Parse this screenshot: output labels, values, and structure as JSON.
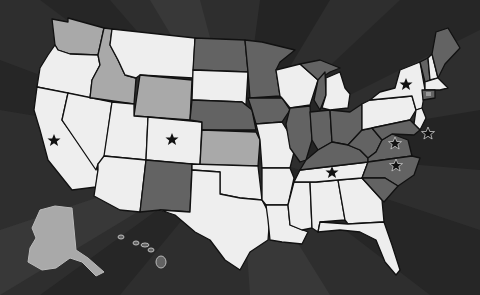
{
  "map": {
    "title": "United States map",
    "style": "grayscale sunburst background",
    "colors": {
      "background": "#2e2e2e",
      "ray_dark": "#262626",
      "ray_light": "#3a3a3a",
      "state_light": "#eeeeee",
      "state_mid": "#a9a9a9",
      "state_dark": "#636363",
      "border": "#111111",
      "star": "#111111"
    },
    "shading": {
      "light": [
        "Oregon",
        "California",
        "Nevada",
        "Utah",
        "Arizona",
        "Montana",
        "Colorado",
        "South Dakota",
        "Oklahoma",
        "Texas",
        "Missouri",
        "Arkansas",
        "Louisiana",
        "Mississippi",
        "Alabama",
        "Georgia",
        "Florida",
        "Tennessee",
        "Wisconsin",
        "Michigan",
        "New York",
        "Pennsylvania",
        "New Jersey",
        "New Hampshire",
        "Massachusetts"
      ],
      "mid": [
        "Washington",
        "Idaho",
        "Wyoming",
        "Kansas",
        "Alaska"
      ],
      "dark": [
        "North Dakota",
        "Minnesota",
        "Nebraska",
        "Iowa",
        "Illinois",
        "Indiana",
        "Ohio",
        "Kentucky",
        "West Virginia",
        "Virginia",
        "North Carolina",
        "South Carolina",
        "New Mexico",
        "Vermont",
        "Maine",
        "Connecticut",
        "Hawaii"
      ]
    },
    "stars": [
      {
        "state": "California",
        "x": 54,
        "y": 140
      },
      {
        "state": "Colorado",
        "x": 172,
        "y": 139
      },
      {
        "state": "New York",
        "x": 406,
        "y": 84
      },
      {
        "state": "Virginia",
        "x": 395,
        "y": 143
      },
      {
        "state": "Delaware/Maryland",
        "x": 428,
        "y": 133
      },
      {
        "state": "North Carolina",
        "x": 396,
        "y": 165
      },
      {
        "state": "Tennessee",
        "x": 332,
        "y": 172
      }
    ]
  }
}
